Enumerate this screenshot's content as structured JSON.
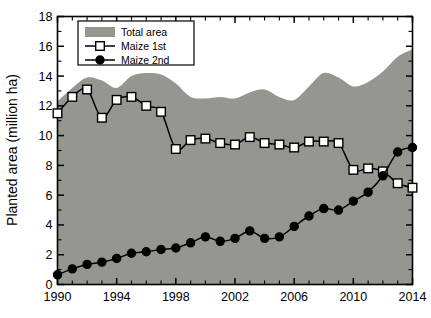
{
  "chart_data": {
    "type": "area",
    "title": "",
    "xlabel": "",
    "ylabel": "Planted area (million ha)",
    "xlim": [
      1990,
      2014
    ],
    "ylim": [
      0,
      18
    ],
    "ytick_step": 2,
    "xtick_step": 4,
    "xminor_step": 1,
    "grid": false,
    "legend_position": "top-left",
    "x": [
      1990,
      1991,
      1992,
      1993,
      1994,
      1995,
      1996,
      1997,
      1998,
      1999,
      2000,
      2001,
      2002,
      2003,
      2004,
      2005,
      2006,
      2007,
      2008,
      2009,
      2010,
      2011,
      2012,
      2013,
      2014
    ],
    "xtick_labels": [
      "1990",
      "1994",
      "1998",
      "2002",
      "2006",
      "2010",
      "2014"
    ],
    "ytick_labels": [
      "0",
      "2",
      "4",
      "6",
      "8",
      "10",
      "12",
      "14",
      "16",
      "18"
    ],
    "series": [
      {
        "name": "Total area",
        "kind": "area",
        "color": "#969690",
        "marker": "none",
        "values": [
          12.3,
          13.2,
          13.9,
          13.7,
          13.2,
          14.0,
          14.2,
          14.1,
          13.5,
          12.6,
          12.5,
          12.6,
          12.5,
          12.9,
          13.1,
          12.6,
          12.4,
          13.3,
          14.2,
          13.9,
          13.3,
          13.6,
          14.3,
          15.3,
          15.8
        ]
      },
      {
        "name": "Maize 1st",
        "kind": "line",
        "color": "#000000",
        "marker": "open-square",
        "values": [
          11.5,
          12.6,
          13.1,
          11.2,
          12.4,
          12.6,
          12.0,
          11.6,
          9.1,
          9.7,
          9.8,
          9.5,
          9.4,
          9.9,
          9.5,
          9.4,
          9.2,
          9.6,
          9.6,
          9.5,
          7.7,
          7.8,
          7.6,
          6.8,
          6.5
        ]
      },
      {
        "name": "Maize 2nd",
        "kind": "line",
        "color": "#000000",
        "marker": "filled-circle",
        "values": [
          0.65,
          1.05,
          1.35,
          1.5,
          1.75,
          2.1,
          2.2,
          2.35,
          2.45,
          2.8,
          3.2,
          2.9,
          3.1,
          3.6,
          3.1,
          3.2,
          3.9,
          4.6,
          5.1,
          5.0,
          5.6,
          6.2,
          7.3,
          8.9,
          9.2
        ]
      }
    ],
    "legend": [
      {
        "label": "Total area",
        "marker": "area-swatch"
      },
      {
        "label": "Maize 1st",
        "marker": "open-square"
      },
      {
        "label": "Maize 2nd",
        "marker": "filled-circle"
      }
    ]
  }
}
